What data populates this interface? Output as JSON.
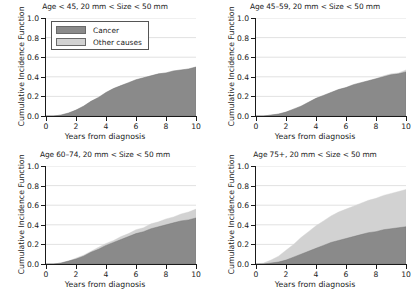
{
  "figure": {
    "axis_label_x": "Years from diagnosis",
    "axis_label_y": "Cumulative Incidence Function",
    "y_ticks": [
      "0.0",
      "0.2",
      "0.4",
      "0.6",
      "0.8",
      "1.0"
    ],
    "x_ticks": [
      "0",
      "2",
      "4",
      "6",
      "8",
      "10"
    ],
    "colors": {
      "cancer": "#8a8a8a",
      "other_causes": "#d2d2d2",
      "axis": "#1a1a1a",
      "grid": "#cccccc",
      "background": "#ffffff"
    }
  },
  "legend": {
    "items": [
      {
        "label": "Cancer",
        "color": "#8a8a8a",
        "swatch_name": "legend-swatch-cancer"
      },
      {
        "label": "Other causes",
        "color": "#d2d2d2",
        "swatch_name": "legend-swatch-other-causes"
      }
    ]
  },
  "chart_data": {
    "type": "area",
    "xlabel": "Years from diagnosis",
    "ylabel": "Cumulative Incidence Function",
    "xlim": [
      0,
      10
    ],
    "ylim": [
      0,
      1.0
    ],
    "xticks": [
      0,
      2,
      4,
      6,
      8,
      10
    ],
    "yticks": [
      0.0,
      0.2,
      0.4,
      0.6,
      0.8,
      1.0
    ],
    "grid": true,
    "legend_position": "upper-left-panel-1",
    "stacked": true,
    "x": [
      0,
      0.5,
      1,
      1.5,
      2,
      2.5,
      3,
      3.5,
      4,
      4.5,
      5,
      5.5,
      6,
      6.5,
      7,
      7.5,
      8,
      8.5,
      9,
      9.5,
      10
    ],
    "panels": [
      {
        "title": "Age < 45, 20 mm < Size < 50 mm",
        "series": [
          {
            "name": "Cancer",
            "color": "#8a8a8a",
            "values": [
              0.0,
              0.0,
              0.01,
              0.03,
              0.06,
              0.1,
              0.15,
              0.19,
              0.24,
              0.28,
              0.31,
              0.34,
              0.37,
              0.39,
              0.41,
              0.43,
              0.44,
              0.46,
              0.47,
              0.48,
              0.5
            ]
          },
          {
            "name": "Other causes",
            "color": "#d2d2d2",
            "values": [
              0.0,
              0.0,
              0.0,
              0.0,
              0.0,
              0.0,
              0.0,
              0.0,
              0.0,
              0.0,
              0.0,
              0.0,
              0.0,
              0.0,
              0.0,
              0.0,
              0.0,
              0.0,
              0.0,
              0.0,
              0.0
            ]
          }
        ]
      },
      {
        "title": "Age 45–59, 20 mm < Size < 50 mm",
        "series": [
          {
            "name": "Cancer",
            "color": "#8a8a8a",
            "values": [
              0.0,
              0.0,
              0.01,
              0.02,
              0.04,
              0.07,
              0.1,
              0.14,
              0.18,
              0.21,
              0.24,
              0.27,
              0.29,
              0.32,
              0.34,
              0.36,
              0.38,
              0.4,
              0.42,
              0.43,
              0.45
            ]
          },
          {
            "name": "Other causes",
            "color": "#d2d2d2",
            "values": [
              0.0,
              0.0,
              0.0,
              0.0,
              0.0,
              0.0,
              0.0,
              0.0,
              0.0,
              0.0,
              0.0,
              0.0,
              0.0,
              0.0,
              0.0,
              0.0,
              0.0,
              0.01,
              0.01,
              0.01,
              0.02
            ]
          }
        ]
      },
      {
        "title": "Age 60–74, 20 mm < Size < 50 mm",
        "series": [
          {
            "name": "Cancer",
            "color": "#8a8a8a",
            "values": [
              0.0,
              0.0,
              0.01,
              0.03,
              0.05,
              0.08,
              0.12,
              0.15,
              0.19,
              0.22,
              0.25,
              0.28,
              0.31,
              0.33,
              0.36,
              0.38,
              0.4,
              0.42,
              0.44,
              0.45,
              0.47
            ]
          },
          {
            "name": "Other causes",
            "color": "#d2d2d2",
            "values": [
              0.0,
              0.0,
              0.0,
              0.0,
              0.01,
              0.01,
              0.01,
              0.02,
              0.02,
              0.02,
              0.03,
              0.03,
              0.04,
              0.04,
              0.05,
              0.05,
              0.06,
              0.06,
              0.07,
              0.08,
              0.09
            ]
          }
        ]
      },
      {
        "title": "Age 75+, 20 mm < Size < 50 mm",
        "series": [
          {
            "name": "Cancer",
            "color": "#8a8a8a",
            "values": [
              0.0,
              0.0,
              0.01,
              0.02,
              0.04,
              0.07,
              0.1,
              0.13,
              0.16,
              0.19,
              0.22,
              0.24,
              0.26,
              0.28,
              0.3,
              0.32,
              0.33,
              0.35,
              0.36,
              0.37,
              0.38
            ]
          },
          {
            "name": "Other causes",
            "color": "#d2d2d2",
            "values": [
              0.0,
              0.01,
              0.03,
              0.06,
              0.1,
              0.13,
              0.17,
              0.2,
              0.23,
              0.25,
              0.27,
              0.29,
              0.3,
              0.31,
              0.32,
              0.33,
              0.34,
              0.35,
              0.36,
              0.37,
              0.38
            ]
          }
        ]
      }
    ]
  }
}
